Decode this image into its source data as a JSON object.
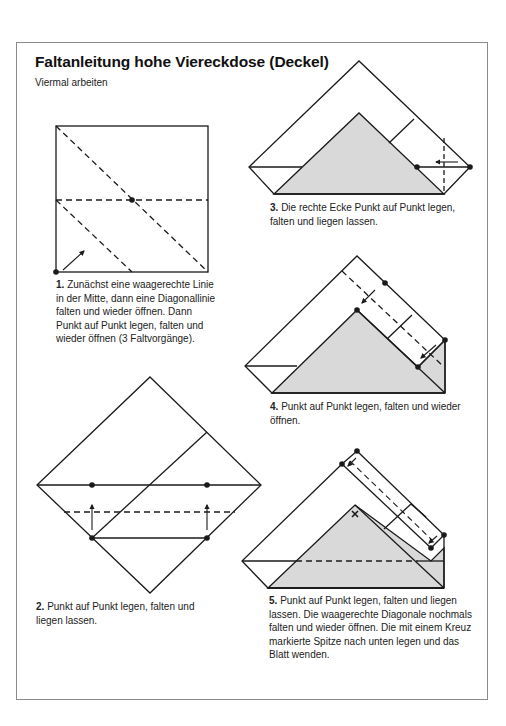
{
  "header": {
    "title": "Faltanleitung hohe Viereckdose (Deckel)",
    "subtitle": "Viermal arbeiten"
  },
  "steps": [
    {
      "number": "1.",
      "text": "Zunächst eine waagerechte Linie in der Mitte, dann eine Diagonallinie falten und wieder öffnen. Dann Punkt auf Punkt legen, falten und wieder öffnen (3 Faltvorgänge)."
    },
    {
      "number": "2.",
      "text": "Punkt auf Punkt legen, falten und liegen lassen."
    },
    {
      "number": "3.",
      "text": "Die rechte Ecke Punkt auf Punkt legen, falten und liegen lassen."
    },
    {
      "number": "4.",
      "text": "Punkt auf Punkt legen, falten und wieder öffnen."
    },
    {
      "number": "5.",
      "text": "Punkt auf Punkt legen, falten und liegen lassen. Die waagerechte Diagonale nochmals falten und wieder öffnen. Die mit einem Kreuz markierte Spitze nach unten legen und das Blatt wenden."
    }
  ],
  "colors": {
    "line": "#1a1a1a",
    "shaded_fill": "#d9d9d9",
    "frame": "#8a8a8a"
  },
  "icons": [
    "dot-marker-icon",
    "arrow-icon",
    "cross-marker-icon",
    "dashed-fold-line"
  ]
}
